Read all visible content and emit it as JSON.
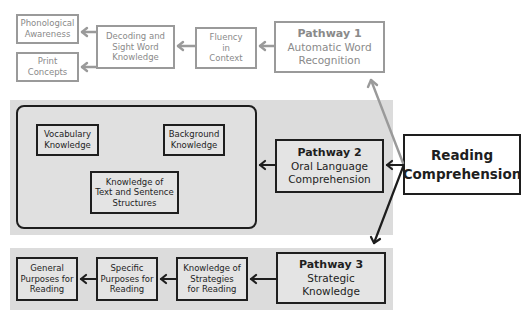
{
  "diagram": {
    "root": {
      "label_line1": "Reading",
      "label_line2": "Comprehension"
    },
    "pathway1": {
      "title": "Pathway 1",
      "subtitle_line1": "Automatic Word",
      "subtitle_line2": "Recognition",
      "color": "#9a9a9a",
      "nodes": {
        "fluency": [
          "Fluency",
          "in",
          "Context"
        ],
        "decoding": [
          "Decoding and",
          "Sight Word",
          "Knowledge"
        ],
        "phonological": [
          "Phonological",
          "Awareness"
        ],
        "print": [
          "Print",
          "Concepts"
        ]
      }
    },
    "pathway2": {
      "title": "Pathway 2",
      "subtitle_line1": "Oral Language",
      "subtitle_line2": "Comprehension",
      "color": "#1e1e1e",
      "nodes": {
        "vocabulary": [
          "Vocabulary",
          "Knowledge"
        ],
        "background": [
          "Background",
          "Knowledge"
        ],
        "text_structures": [
          "Knowledge of",
          "Text and Sentence",
          "Structures"
        ]
      }
    },
    "pathway3": {
      "title": "Pathway 3",
      "subtitle_line1": "Strategic",
      "subtitle_line2": "Knowledge",
      "color": "#1e1e1e",
      "nodes": {
        "strategies": [
          "Knowledge of",
          "Strategies",
          "for Reading"
        ],
        "specific": [
          "Specific",
          "Purposes for",
          "Reading"
        ],
        "general": [
          "General",
          "Purposes for",
          "Reading"
        ]
      }
    },
    "panel_color": "#dcdcdc"
  }
}
